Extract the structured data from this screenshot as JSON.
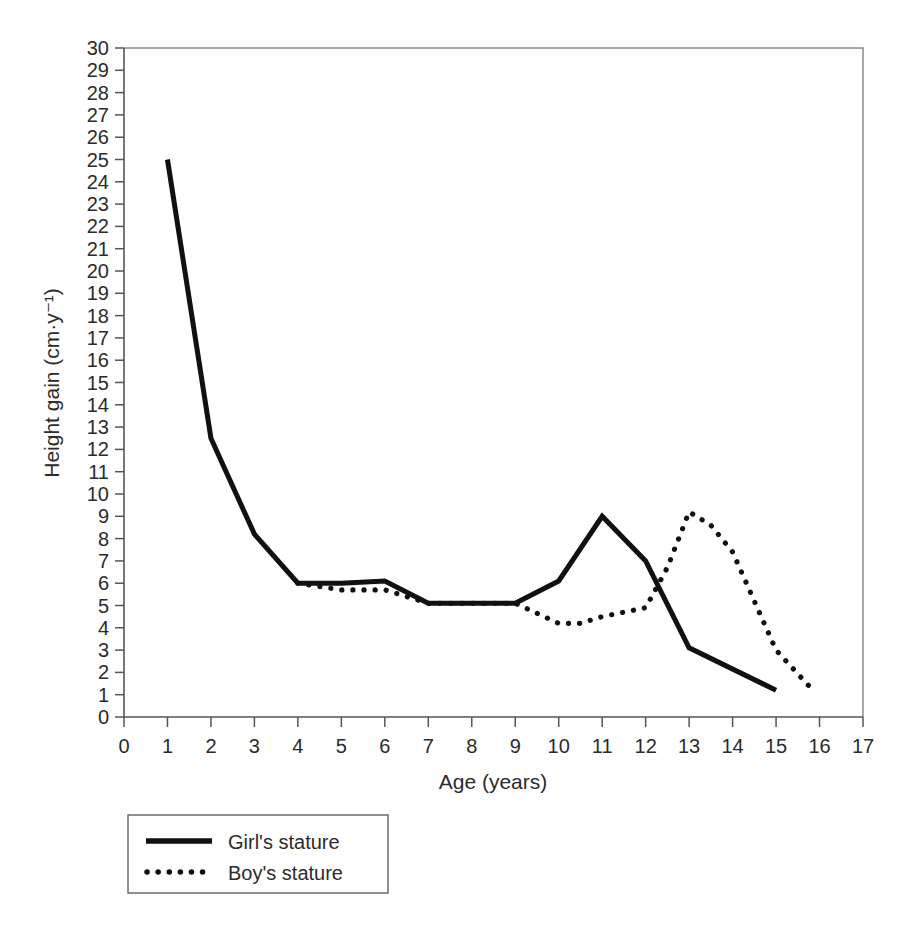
{
  "chart_data": {
    "type": "line",
    "title": "",
    "xlabel": "Age (years)",
    "ylabel": "Height gain (cm·y⁻¹)",
    "xlim": [
      0,
      17
    ],
    "ylim": [
      0,
      30
    ],
    "xticks": [
      0,
      1,
      2,
      3,
      4,
      5,
      6,
      7,
      8,
      9,
      10,
      11,
      12,
      13,
      14,
      15,
      16,
      17
    ],
    "yticks": [
      0,
      1,
      2,
      3,
      4,
      5,
      6,
      7,
      8,
      9,
      10,
      11,
      12,
      13,
      14,
      15,
      16,
      17,
      18,
      19,
      20,
      21,
      22,
      23,
      24,
      25,
      26,
      27,
      28,
      29,
      30
    ],
    "xtick_labels": [
      "0",
      "1",
      "2",
      "3",
      "4",
      "5",
      "6",
      "7",
      "8",
      "9",
      "10",
      "11",
      "12",
      "13",
      "14",
      "15",
      "16",
      "17"
    ],
    "ytick_labels": [
      "0",
      "1",
      "2",
      "3",
      "4",
      "5",
      "6",
      "7",
      "8",
      "9",
      "10",
      "11",
      "12",
      "13",
      "14",
      "15",
      "16",
      "17",
      "18",
      "19",
      "20",
      "21",
      "22",
      "23",
      "24",
      "25",
      "26",
      "27",
      "28",
      "29",
      "30"
    ],
    "grid": false,
    "legend_position": "below-left",
    "series": [
      {
        "name": "Girl's stature",
        "style": "solid",
        "color": "#111111",
        "x": [
          1,
          2,
          3,
          4,
          5,
          6,
          7,
          8,
          9,
          10,
          11,
          12,
          13,
          15
        ],
        "values": [
          25.0,
          12.5,
          8.2,
          6.0,
          6.0,
          6.1,
          5.1,
          5.1,
          5.1,
          6.1,
          9.0,
          7.0,
          3.1,
          1.2
        ]
      },
      {
        "name": "Boy's stature",
        "style": "dotted",
        "color": "#111111",
        "x": [
          4,
          5,
          6,
          7,
          8,
          9,
          10,
          10.5,
          11,
          12,
          12.5,
          13,
          13.5,
          14,
          15,
          15.8
        ],
        "values": [
          6.0,
          5.7,
          5.7,
          5.1,
          5.1,
          5.1,
          4.2,
          4.2,
          4.5,
          4.9,
          6.7,
          9.2,
          8.6,
          7.4,
          3.0,
          1.3
        ]
      }
    ]
  },
  "legend": {
    "items": [
      {
        "label": "Girl's stature",
        "style": "solid"
      },
      {
        "label": "Boy's stature",
        "style": "dotted"
      }
    ]
  }
}
